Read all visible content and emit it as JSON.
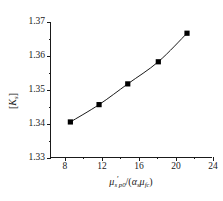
{
  "figure": {
    "background_color": "#ffffff",
    "line_color": "#1a1a1a",
    "marker_color": "#000000"
  },
  "axes": {
    "y_label_parts": {
      "open_bracket": "[",
      "symbol": "K",
      "subscript": "s",
      "close_bracket": "]"
    },
    "x_label_parts": {
      "mu1": "μ",
      "sub1": "s",
      "sub1b": "p0",
      "prime": "′",
      "slash": "/(",
      "alpha": "α",
      "alpha_sub": "s",
      "mu2": "μ",
      "mu2_sub": "f",
      "mu2_subsub": "c",
      "close": ")"
    },
    "y_ticks": [
      "1.33",
      "1.34",
      "1.35",
      "1.36",
      "1.37"
    ],
    "x_ticks": [
      "8",
      "12",
      "16",
      "20",
      "24"
    ]
  },
  "chart_data": {
    "type": "line",
    "title": "",
    "xlabel": "μ′_{s,p0}/(α_s μ_{f,c})",
    "ylabel": "[K_s]",
    "xlim": [
      6.5,
      24.0
    ],
    "ylim": [
      1.33,
      1.37
    ],
    "xticks": [
      8,
      12,
      16,
      20,
      24
    ],
    "yticks": [
      1.33,
      1.34,
      1.35,
      1.36,
      1.37
    ],
    "x_minor_ticks": [
      10,
      14,
      18,
      22
    ],
    "y_minor_ticks": [
      1.335,
      1.345,
      1.355,
      1.365
    ],
    "grid": false,
    "legend": false,
    "marker": "square",
    "series": [
      {
        "name": "[K_s]",
        "x": [
          8.7,
          11.8,
          14.9,
          18.2,
          21.3
        ],
        "values": [
          1.3406,
          1.3457,
          1.3518,
          1.3583,
          1.3667
        ]
      }
    ]
  }
}
